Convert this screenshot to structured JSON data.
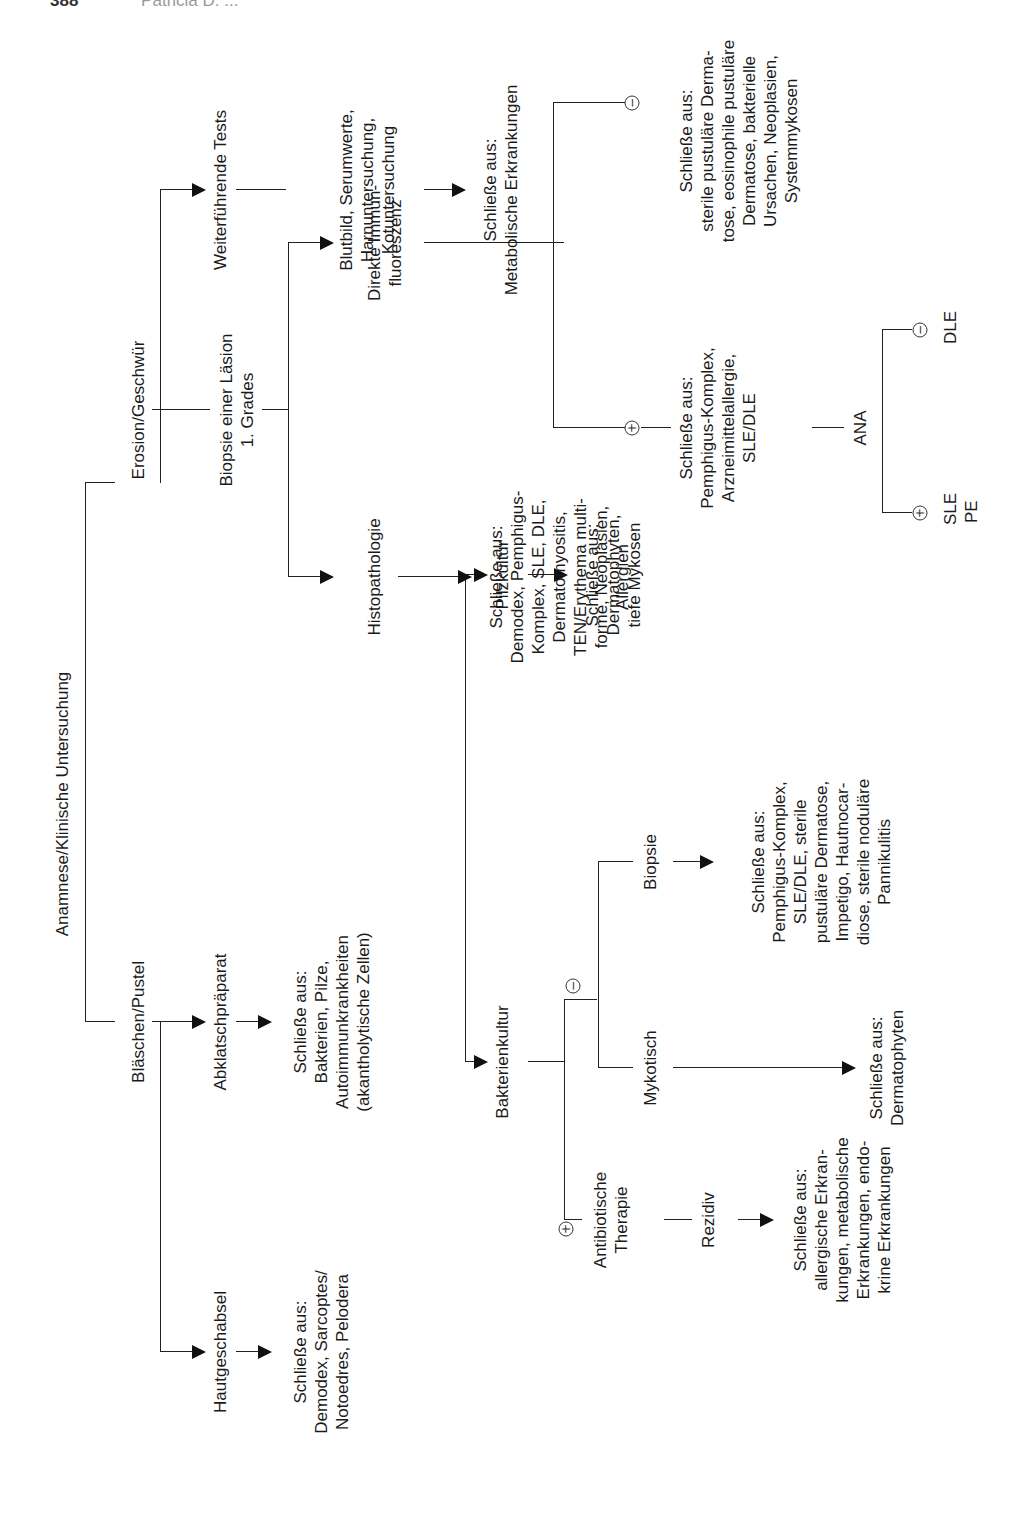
{
  "page_header": {
    "page_number": "388",
    "author": "Patricia D. ..."
  },
  "diagram": {
    "root": {
      "label": "Anamnese/Klinische Untersuchung"
    },
    "branches": {
      "blaeschen": {
        "label": "Bläschen/Pustel",
        "tests": {
          "hautgeschabsel": {
            "label": "Hautgeschabsel",
            "result": [
              "Schließe aus:",
              "Demodex, Sarcoptes/",
              "Notoedres, Pelodera"
            ]
          },
          "abklatsch": {
            "label": "Abklatschpräparat",
            "result": [
              "Schließe aus:",
              "Bakterien, Pilze,",
              "Autoimmunkrankheiten",
              "(akantholytische Zellen)"
            ]
          },
          "bakterienkultur": {
            "label": "Bakterienkultur",
            "positive": {
              "sign": "+",
              "label": [
                "Antibiotische",
                "Therapie"
              ],
              "rezidiv": "Rezidiv",
              "result": [
                "Schließe aus:",
                "allergische Erkran-",
                "kungen, metabolische",
                "Erkrankungen, endo-",
                "krine Erkrankungen"
              ]
            },
            "negative": {
              "sign": "−",
              "mykotisch": {
                "label": "Mykotisch",
                "result": [
                  "Schließe aus:",
                  "Dermatophyten"
                ]
              },
              "biopsie": {
                "label": "Biopsie",
                "result": [
                  "Schließe aus:",
                  "Pemphigus-Komplex,",
                  "SLE/DLE, sterile",
                  "pustuläre Dermatose,",
                  "Impetigo, Hautnocar-",
                  "diose, sterile noduläre",
                  "Pannikulitis"
                ]
              }
            }
          },
          "pilzkultur": {
            "label": "Pilzkultur",
            "result": [
              "Schließe aus:",
              "Dermatophyten,",
              "tiefe Mykosen"
            ]
          }
        }
      },
      "erosion": {
        "label": "Erosion/Geschwür",
        "tests": {
          "biopsie_laesion": {
            "label": [
              "Biopsie einer Läsion",
              "1. Grades"
            ],
            "histopathologie": {
              "label": "Histopathologie",
              "result": [
                "Schließe aus:",
                "Demodex, Pemphigus-",
                "Komplex, SLE, DLE,",
                "Dermatomyositis,",
                "TEN/Erythema multi-",
                "forme, Neoplasien,",
                "Allergien"
              ]
            },
            "immunfluoreszenz": {
              "label": [
                "Direkte Immun-",
                "fluoreszenz"
              ],
              "positive": {
                "sign": "+",
                "result": [
                  "Schließe aus:",
                  "Pemphigus-Komplex,",
                  "Arzneimittelallergie,",
                  "SLE/DLE"
                ],
                "ana": {
                  "label": "ANA",
                  "positive": {
                    "sign": "+",
                    "result": [
                      "SLE",
                      "PE"
                    ]
                  },
                  "negative": {
                    "sign": "−",
                    "result": [
                      "DLE"
                    ]
                  }
                }
              },
              "negative": {
                "sign": "−",
                "result": [
                  "Schließe aus:",
                  "sterile pustuläre Derma-",
                  "tose, eosinophile pustuläre",
                  "Dermatose, bakterielle",
                  "Ursachen, Neoplasien,",
                  "Systemmykosen"
                ]
              }
            }
          },
          "weiterfuehrend": {
            "label": "Weiterführende Tests",
            "sub": [
              "Blutbild, Serumwerte,",
              "Harnuntersuchung,",
              "Kotuntersuchung"
            ],
            "result": [
              "Schließe aus:",
              "Metabolische Erkrankungen"
            ]
          }
        }
      }
    }
  }
}
